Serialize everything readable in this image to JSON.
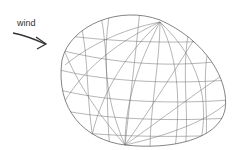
{
  "diagram": {
    "wind_label": "wind",
    "arrow_direction": "right",
    "shape": "wireframe-egg",
    "stroke_color": "#555555"
  }
}
